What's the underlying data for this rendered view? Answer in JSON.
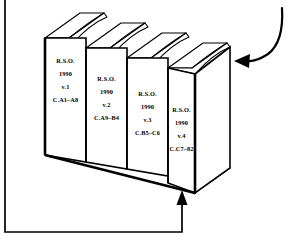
{
  "figure": {
    "background_color": "#ffffff",
    "ink_color": "#000000"
  },
  "books": [
    {
      "id": "book-1",
      "position": 1,
      "lines": [
        "R.S.O.",
        "1990",
        "v.1",
        "C.A1–A8"
      ],
      "publisher": "R.S.O.",
      "year": "1990",
      "volume": "v.1",
      "call_number": "C.A1–A8"
    },
    {
      "id": "book-2",
      "position": 2,
      "lines": [
        "R.S.O.",
        "1990",
        "v.2",
        "C.A9–B4"
      ],
      "publisher": "R.S.O.",
      "year": "1990",
      "volume": "v.2",
      "call_number": "C.A9–B4"
    },
    {
      "id": "book-3",
      "position": 3,
      "lines": [
        "R.S.O.",
        "1990",
        "v.3",
        "C.B5–C6"
      ],
      "publisher": "R.S.O.",
      "year": "1990",
      "volume": "v.3",
      "call_number": "C.B5–C6"
    },
    {
      "id": "book-4",
      "position": 4,
      "lines": [
        "R.S.O.",
        "1990",
        "v.4",
        "C.C7–82"
      ],
      "publisher": "R.S.O.",
      "year": "1990",
      "volume": "v.4",
      "call_number": "C.C7–82"
    }
  ],
  "annotations": [
    {
      "id": "top-arrow",
      "kind": "curved-arrow",
      "from": "top-right edge of image",
      "points_to": "top cover of volume 4",
      "direction": "down-left"
    },
    {
      "id": "bottom-arrow",
      "kind": "elbow-arrow",
      "from": "left edge of image",
      "points_to": "bottom edge of volume 4",
      "direction": "up"
    }
  ]
}
